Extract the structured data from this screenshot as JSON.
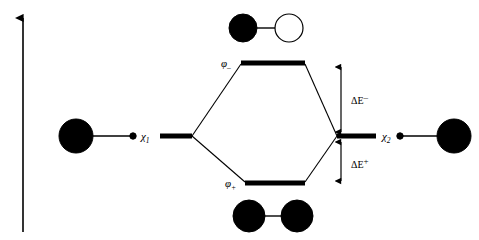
{
  "diagram": {
    "type": "mo-energy-level-diagram",
    "colors": {
      "stroke": "#000000",
      "filled_lobe": "#000000",
      "empty_lobe": "#ffffff",
      "background": "#ffffff"
    },
    "energy_axis": {
      "name": "energy-axis",
      "label": "",
      "direction": "up",
      "x": 23,
      "y_top": 14,
      "y_bottom": 232
    },
    "levels": [
      {
        "id": "chi1",
        "name": "level-chi1",
        "label": "χ",
        "subscript": "1",
        "x_left": 160,
        "x_right": 192,
        "y": 136
      },
      {
        "id": "phi_minus",
        "name": "level-phi-minus",
        "label": "φ",
        "subscript": "–",
        "x_left": 241,
        "x_right": 305,
        "y": 63
      },
      {
        "id": "phi_plus",
        "name": "level-phi-plus",
        "label": "φ",
        "subscript": "+",
        "x_left": 245,
        "x_right": 305,
        "y": 183
      },
      {
        "id": "chi2",
        "name": "level-chi2",
        "label": "χ",
        "subscript": "2",
        "x_left": 337,
        "x_right": 376,
        "y": 136
      }
    ],
    "energy_gaps": [
      {
        "id": "dE_minus",
        "name": "energy-gap-antibonding",
        "symbol": "ΔE",
        "superscript": "–",
        "x": 341,
        "y_top": 65,
        "y_bottom": 133
      },
      {
        "id": "dE_plus",
        "name": "energy-gap-bonding",
        "symbol": "ΔE",
        "superscript": "+",
        "x": 341,
        "y_top": 140,
        "y_bottom": 182
      }
    ],
    "orbitals": [
      {
        "id": "atomic_left",
        "name": "orbital-atomic-left",
        "description": "large filled lobe with small node dot",
        "lobes": [
          {
            "cx": 76,
            "cy": 136,
            "r": 17,
            "fill": "filled"
          },
          {
            "cx": 133,
            "cy": 136,
            "r": 3.2,
            "fill": "filled"
          }
        ],
        "bond": {
          "x1": 93,
          "y1": 136,
          "x2": 131,
          "y2": 136
        }
      },
      {
        "id": "atomic_right",
        "name": "orbital-atomic-right",
        "description": "small node dot with large filled lobe",
        "lobes": [
          {
            "cx": 400,
            "cy": 136,
            "r": 3.2,
            "fill": "filled"
          },
          {
            "cx": 454,
            "cy": 136,
            "r": 17,
            "fill": "filled"
          }
        ],
        "bond": {
          "x1": 402,
          "y1": 136,
          "x2": 437,
          "y2": 136
        }
      },
      {
        "id": "mo_antibonding",
        "name": "orbital-antibonding",
        "description": "filled lobe plus empty lobe (out of phase)",
        "lobes": [
          {
            "cx": 243,
            "cy": 28,
            "r": 14,
            "fill": "filled"
          },
          {
            "cx": 289,
            "cy": 28,
            "r": 14,
            "fill": "empty"
          }
        ],
        "bond": {
          "x1": 257,
          "y1": 28,
          "x2": 275,
          "y2": 28
        }
      },
      {
        "id": "mo_bonding",
        "name": "orbital-bonding",
        "description": "two filled lobes (in phase)",
        "lobes": [
          {
            "cx": 249,
            "cy": 216,
            "r": 16,
            "fill": "filled"
          },
          {
            "cx": 297,
            "cy": 216,
            "r": 16,
            "fill": "filled"
          }
        ],
        "bond": {
          "x1": 265,
          "y1": 216,
          "x2": 281,
          "y2": 216
        }
      }
    ],
    "correlation_lines": [
      {
        "name": "correlation-chi1-to-phi-minus",
        "x1": 192,
        "y1": 136,
        "x2": 241,
        "y2": 63
      },
      {
        "name": "correlation-chi1-to-phi-plus",
        "x1": 192,
        "y1": 136,
        "x2": 245,
        "y2": 183
      },
      {
        "name": "correlation-chi2-to-phi-minus",
        "x1": 337,
        "y1": 136,
        "x2": 305,
        "y2": 63
      },
      {
        "name": "correlation-chi2-to-phi-plus",
        "x1": 337,
        "y1": 136,
        "x2": 305,
        "y2": 183
      }
    ],
    "label_positions": {
      "chi1": {
        "x": 141,
        "y": 140,
        "sub_dx": 7,
        "sub_dy": 3
      },
      "chi2": {
        "x": 382,
        "y": 140,
        "sub_dx": 7,
        "sub_dy": 3
      },
      "phi_minus": {
        "x": 222,
        "y": 67,
        "sub_dx": 7,
        "sub_dy": 3
      },
      "phi_plus": {
        "x": 226,
        "y": 187,
        "sub_dx": 7,
        "sub_dy": 3
      },
      "dE_minus": {
        "x": 352,
        "y": 103,
        "sup_dx": 17,
        "sup_dy": -4
      },
      "dE_plus": {
        "x": 352,
        "y": 167,
        "sup_dx": 17,
        "sup_dy": -4
      }
    }
  }
}
